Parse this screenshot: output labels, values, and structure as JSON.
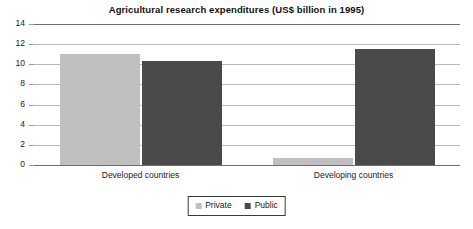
{
  "chart_data": {
    "type": "bar",
    "title": "Agricultural research expenditures (US$ billion in 1995)",
    "xlabel": "",
    "ylabel": "",
    "ylim": [
      0,
      14
    ],
    "yticks": [
      0,
      2,
      4,
      6,
      8,
      10,
      12,
      14
    ],
    "ytick_labels": [
      "0",
      "2",
      "4",
      "6",
      "8",
      "10",
      "12",
      "14"
    ],
    "grid": true,
    "legend_position": "bottom-center",
    "categories": [
      "Developed countries",
      "Developing countries"
    ],
    "series": [
      {
        "name": "Private",
        "color": "#c0c0c0",
        "values": [
          11.0,
          0.7
        ]
      },
      {
        "name": "Public",
        "color": "#4a4a4a",
        "values": [
          10.3,
          11.5
        ]
      }
    ]
  },
  "legend": {
    "items": [
      {
        "label": "Private",
        "color": "#c0c0c0"
      },
      {
        "label": "Public",
        "color": "#4a4a4a"
      }
    ]
  },
  "colors": {
    "background": "#ffffff",
    "gridline": "#b9b9b9",
    "axis": "#6f6f6f",
    "text": "#1a1a1a",
    "private": "#c0c0c0",
    "public": "#4a4a4a"
  }
}
